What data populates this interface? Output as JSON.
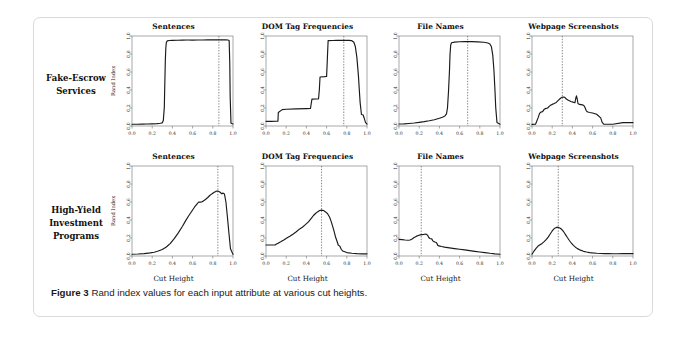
{
  "figure": {
    "caption_label": "Figure 3",
    "caption_text": "Rand index values for each input attribute at various cut heights."
  },
  "row_labels": [
    "Fake-Escrow Services",
    "High-Yield Investment Programs"
  ],
  "column_titles": [
    "Sentences",
    "DOM Tag Frequencies",
    "File Names",
    "Webpage Screenshots"
  ],
  "axes": {
    "xlabel": "Cut Height",
    "ylabel": "Rand Index",
    "xticks": [
      "0.0",
      "0.2",
      "0.4",
      "0.6",
      "0.8",
      "1.0"
    ],
    "yticks": [
      "0.0",
      "0.2",
      "0.4",
      "0.6",
      "0.8",
      "1.0"
    ],
    "xlim": [
      0.0,
      1.0
    ],
    "ylim": [
      0.0,
      1.0
    ],
    "grid": false
  },
  "style": {
    "line_color": "#1a1a1a",
    "frame_color": "#6e6e6e",
    "cut_line_color": "#555555",
    "card_border_color": "#d9d9d9"
  },
  "chart_data": [
    {
      "type": "line",
      "title": "Sentences",
      "row": "Fake-Escrow Services",
      "xlabel": "Cut Height",
      "ylabel": "Rand Index",
      "xlim": [
        0.0,
        1.0
      ],
      "ylim": [
        0.0,
        1.0
      ],
      "cut_height_marker": 0.86,
      "x": [
        0.0,
        0.05,
        0.1,
        0.15,
        0.2,
        0.25,
        0.28,
        0.3,
        0.31,
        0.32,
        0.325,
        0.33,
        0.335,
        0.34,
        0.35,
        0.37,
        0.4,
        0.45,
        0.5,
        0.55,
        0.6,
        0.65,
        0.7,
        0.75,
        0.8,
        0.86,
        0.9,
        0.93,
        0.95,
        0.962,
        0.968,
        0.972,
        0.98,
        1.0
      ],
      "y": [
        0.02,
        0.02,
        0.021,
        0.022,
        0.024,
        0.027,
        0.03,
        0.035,
        0.06,
        0.21,
        0.48,
        0.73,
        0.87,
        0.93,
        0.946,
        0.95,
        0.952,
        0.953,
        0.954,
        0.955,
        0.955,
        0.956,
        0.956,
        0.957,
        0.957,
        0.957,
        0.957,
        0.957,
        0.956,
        0.95,
        0.7,
        0.33,
        0.03,
        0.022
      ]
    },
    {
      "type": "line",
      "title": "DOM Tag Frequencies",
      "row": "Fake-Escrow Services",
      "xlabel": "Cut Height",
      "ylabel": "Rand Index",
      "xlim": [
        0.0,
        1.0
      ],
      "ylim": [
        0.0,
        1.0
      ],
      "cut_height_marker": 0.77,
      "x": [
        0.0,
        0.05,
        0.1,
        0.118,
        0.122,
        0.16,
        0.2,
        0.3,
        0.4,
        0.44,
        0.448,
        0.455,
        0.5,
        0.52,
        0.528,
        0.535,
        0.58,
        0.6,
        0.608,
        0.615,
        0.66,
        0.7,
        0.77,
        0.82,
        0.85,
        0.87,
        0.885,
        0.9,
        0.915,
        0.925,
        0.932,
        0.94,
        0.945,
        0.955,
        0.962,
        0.97,
        0.985,
        1.0
      ],
      "y": [
        0.052,
        0.052,
        0.053,
        0.053,
        0.15,
        0.182,
        0.186,
        0.19,
        0.193,
        0.194,
        0.25,
        0.298,
        0.3,
        0.302,
        0.4,
        0.545,
        0.548,
        0.55,
        0.76,
        0.948,
        0.95,
        0.951,
        0.952,
        0.952,
        0.948,
        0.93,
        0.88,
        0.76,
        0.56,
        0.38,
        0.26,
        0.18,
        0.128,
        0.125,
        0.122,
        0.095,
        0.04,
        0.022
      ]
    },
    {
      "type": "line",
      "title": "File Names",
      "row": "Fake-Escrow Services",
      "xlabel": "Cut Height",
      "ylabel": "Rand Index",
      "xlim": [
        0.0,
        1.0
      ],
      "ylim": [
        0.0,
        1.0
      ],
      "cut_height_marker": 0.68,
      "x": [
        0.0,
        0.05,
        0.1,
        0.15,
        0.2,
        0.25,
        0.3,
        0.35,
        0.4,
        0.43,
        0.455,
        0.47,
        0.48,
        0.49,
        0.5,
        0.505,
        0.512,
        0.52,
        0.55,
        0.6,
        0.65,
        0.68,
        0.72,
        0.78,
        0.84,
        0.88,
        0.9,
        0.915,
        0.928,
        0.94,
        0.95,
        0.958,
        0.97,
        1.0
      ],
      "y": [
        0.022,
        0.024,
        0.028,
        0.033,
        0.04,
        0.048,
        0.058,
        0.07,
        0.086,
        0.098,
        0.112,
        0.135,
        0.2,
        0.38,
        0.62,
        0.79,
        0.9,
        0.925,
        0.932,
        0.936,
        0.938,
        0.939,
        0.938,
        0.935,
        0.93,
        0.922,
        0.912,
        0.88,
        0.79,
        0.62,
        0.4,
        0.2,
        0.04,
        0.02
      ]
    },
    {
      "type": "line",
      "title": "Webpage Screenshots",
      "row": "Fake-Escrow Services",
      "xlabel": "Cut Height",
      "ylabel": "Rand Index",
      "xlim": [
        0.0,
        1.0
      ],
      "ylim": [
        0.0,
        1.0
      ],
      "cut_height_marker": 0.3,
      "x": [
        0.0,
        0.035,
        0.06,
        0.075,
        0.09,
        0.105,
        0.12,
        0.14,
        0.155,
        0.17,
        0.185,
        0.2,
        0.22,
        0.24,
        0.26,
        0.28,
        0.295,
        0.31,
        0.325,
        0.34,
        0.355,
        0.37,
        0.385,
        0.4,
        0.415,
        0.425,
        0.432,
        0.44,
        0.448,
        0.455,
        0.47,
        0.485,
        0.5,
        0.515,
        0.525,
        0.535,
        0.545,
        0.555,
        0.57,
        0.6,
        0.64,
        0.68,
        0.695,
        0.71,
        0.8,
        0.9,
        1.0
      ],
      "y": [
        0.018,
        0.02,
        0.09,
        0.14,
        0.155,
        0.16,
        0.185,
        0.196,
        0.2,
        0.218,
        0.232,
        0.24,
        0.25,
        0.262,
        0.285,
        0.305,
        0.318,
        0.322,
        0.318,
        0.3,
        0.288,
        0.28,
        0.272,
        0.268,
        0.262,
        0.258,
        0.3,
        0.335,
        0.3,
        0.25,
        0.24,
        0.238,
        0.235,
        0.225,
        0.205,
        0.175,
        0.16,
        0.155,
        0.15,
        0.145,
        0.13,
        0.09,
        0.04,
        0.02,
        0.02,
        0.038,
        0.038
      ]
    },
    {
      "type": "line",
      "title": "Sentences",
      "row": "High-Yield Investment Programs",
      "xlabel": "Cut Height",
      "ylabel": "Rand Index",
      "xlim": [
        0.0,
        1.0
      ],
      "ylim": [
        0.0,
        1.0
      ],
      "cut_height_marker": 0.85,
      "x": [
        0.0,
        0.06,
        0.12,
        0.18,
        0.22,
        0.26,
        0.3,
        0.34,
        0.38,
        0.42,
        0.46,
        0.5,
        0.53,
        0.56,
        0.59,
        0.62,
        0.645,
        0.66,
        0.675,
        0.69,
        0.71,
        0.73,
        0.75,
        0.77,
        0.79,
        0.81,
        0.83,
        0.845,
        0.86,
        0.875,
        0.89,
        0.9,
        0.915,
        0.93,
        0.945,
        0.96,
        0.975,
        1.0
      ],
      "y": [
        0.02,
        0.022,
        0.026,
        0.034,
        0.042,
        0.055,
        0.072,
        0.1,
        0.14,
        0.195,
        0.26,
        0.33,
        0.39,
        0.445,
        0.495,
        0.545,
        0.58,
        0.6,
        0.598,
        0.6,
        0.615,
        0.63,
        0.65,
        0.672,
        0.69,
        0.705,
        0.718,
        0.722,
        0.718,
        0.705,
        0.69,
        0.7,
        0.69,
        0.6,
        0.43,
        0.25,
        0.08,
        0.018
      ]
    },
    {
      "type": "line",
      "title": "DOM Tag Frequencies",
      "row": "High-Yield Investment Programs",
      "xlabel": "Cut Height",
      "ylabel": "Rand Index",
      "xlim": [
        0.0,
        1.0
      ],
      "ylim": [
        0.0,
        1.0
      ],
      "cut_height_marker": 0.55,
      "x": [
        0.0,
        0.05,
        0.09,
        0.1,
        0.12,
        0.15,
        0.18,
        0.21,
        0.24,
        0.27,
        0.3,
        0.33,
        0.36,
        0.39,
        0.42,
        0.45,
        0.47,
        0.49,
        0.51,
        0.53,
        0.55,
        0.57,
        0.59,
        0.61,
        0.63,
        0.645,
        0.66,
        0.675,
        0.69,
        0.7,
        0.715,
        0.73,
        0.745,
        0.76,
        0.8,
        0.85,
        0.9,
        0.95,
        1.0
      ],
      "y": [
        0.122,
        0.122,
        0.122,
        0.13,
        0.142,
        0.16,
        0.18,
        0.202,
        0.222,
        0.245,
        0.27,
        0.298,
        0.32,
        0.348,
        0.38,
        0.42,
        0.45,
        0.472,
        0.49,
        0.505,
        0.51,
        0.505,
        0.49,
        0.47,
        0.43,
        0.385,
        0.33,
        0.27,
        0.205,
        0.175,
        0.122,
        0.11,
        0.075,
        0.055,
        0.038,
        0.03,
        0.026,
        0.024,
        0.024
      ]
    },
    {
      "type": "line",
      "title": "File Names",
      "row": "High-Yield Investment Programs",
      "xlabel": "Cut Height",
      "ylabel": "Rand Index",
      "xlim": [
        0.0,
        1.0
      ],
      "ylim": [
        0.0,
        1.0
      ],
      "cut_height_marker": 0.22,
      "x": [
        0.0,
        0.03,
        0.06,
        0.09,
        0.11,
        0.13,
        0.15,
        0.17,
        0.19,
        0.21,
        0.23,
        0.245,
        0.255,
        0.265,
        0.275,
        0.285,
        0.295,
        0.305,
        0.315,
        0.325,
        0.335,
        0.345,
        0.355,
        0.37,
        0.385,
        0.395,
        0.405,
        0.42,
        0.45,
        0.5,
        0.55,
        0.6,
        0.65,
        0.7,
        0.75,
        0.8,
        0.85,
        0.9,
        0.95,
        1.0
      ],
      "y": [
        0.185,
        0.182,
        0.178,
        0.175,
        0.178,
        0.19,
        0.205,
        0.218,
        0.228,
        0.235,
        0.238,
        0.24,
        0.242,
        0.243,
        0.238,
        0.228,
        0.205,
        0.195,
        0.192,
        0.19,
        0.168,
        0.16,
        0.155,
        0.15,
        0.118,
        0.112,
        0.11,
        0.105,
        0.098,
        0.09,
        0.082,
        0.075,
        0.068,
        0.06,
        0.052,
        0.045,
        0.038,
        0.03,
        0.024,
        0.02
      ]
    },
    {
      "type": "line",
      "title": "Webpage Screenshots",
      "row": "High-Yield Investment Programs",
      "xlabel": "Cut Height",
      "ylabel": "Rand Index",
      "xlim": [
        0.0,
        1.0
      ],
      "ylim": [
        0.0,
        1.0
      ],
      "cut_height_marker": 0.26,
      "x": [
        0.0,
        0.02,
        0.04,
        0.06,
        0.08,
        0.1,
        0.12,
        0.14,
        0.16,
        0.18,
        0.2,
        0.215,
        0.23,
        0.245,
        0.26,
        0.275,
        0.29,
        0.305,
        0.32,
        0.335,
        0.35,
        0.37,
        0.39,
        0.41,
        0.43,
        0.45,
        0.48,
        0.51,
        0.54,
        0.57,
        0.6,
        0.64,
        0.68,
        0.72,
        0.76,
        0.8,
        0.85,
        0.9,
        0.95,
        1.0
      ],
      "y": [
        0.02,
        0.055,
        0.085,
        0.11,
        0.125,
        0.14,
        0.16,
        0.182,
        0.21,
        0.245,
        0.278,
        0.298,
        0.312,
        0.318,
        0.318,
        0.312,
        0.3,
        0.282,
        0.258,
        0.232,
        0.205,
        0.172,
        0.142,
        0.118,
        0.098,
        0.082,
        0.065,
        0.052,
        0.044,
        0.038,
        0.034,
        0.03,
        0.028,
        0.026,
        0.026,
        0.025,
        0.025,
        0.026,
        0.026,
        0.026
      ]
    }
  ]
}
